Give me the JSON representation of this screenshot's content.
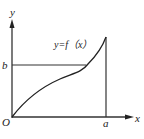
{
  "diagram": {
    "type": "function-graph",
    "axes": {
      "x_label": "x",
      "y_label": "y",
      "origin_label": "O"
    },
    "marks": {
      "x_mark": "a",
      "y_mark": "b"
    },
    "curve": {
      "label": "y=f（x）",
      "description": "increasing curve from origin to (a, f(a)), concave down then concave up"
    },
    "colors": {
      "stroke": "#222222",
      "background": "#ffffff"
    }
  }
}
